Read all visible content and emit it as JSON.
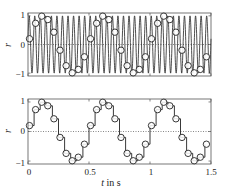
{
  "figure": {
    "background": "#ffffff",
    "line_color": "#222222",
    "frame_color": "#555555",
    "zero_line_color": "#555555"
  },
  "chart_data": [
    {
      "type": "line",
      "panel": "top",
      "title": "",
      "xlabel": "",
      "ylabel": "r",
      "xlim": [
        0,
        1.5
      ],
      "ylim": [
        -1.1,
        1.1
      ],
      "yticks": [
        -1,
        0,
        1
      ],
      "ytick_labels": [
        "−1",
        "0",
        "1"
      ],
      "xticks": [
        0,
        0.5,
        1,
        1.5
      ],
      "xtick_labels": [],
      "grid": false,
      "zero_line": "dotted",
      "series": [
        {
          "name": "continuous signal",
          "style": "solid line",
          "function": "sin(2*pi*22*t + 0.2)",
          "frequency_hz": 22,
          "phase_rad": 0.2,
          "t_start": 0,
          "t_end": 1.5
        },
        {
          "name": "samples",
          "style": "circle markers",
          "sampling_interval_s": 0.05,
          "t": [
            0,
            0.05,
            0.1,
            0.15,
            0.2,
            0.25,
            0.3,
            0.35,
            0.4,
            0.45,
            0.5,
            0.55,
            0.6,
            0.65,
            0.7,
            0.75,
            0.8,
            0.85,
            0.9,
            0.95,
            1.0,
            1.05,
            1.1,
            1.15,
            1.2,
            1.25,
            1.3,
            1.35,
            1.4,
            1.45
          ],
          "values": [
            0.2,
            0.74,
            0.99,
            0.87,
            0.43,
            -0.2,
            -0.74,
            -0.99,
            -0.87,
            -0.43,
            0.2,
            0.74,
            0.99,
            0.87,
            0.43,
            -0.2,
            -0.74,
            -0.99,
            -0.87,
            -0.43,
            0.2,
            0.74,
            0.99,
            0.87,
            0.43,
            -0.2,
            -0.74,
            -0.99,
            -0.87,
            -0.43
          ]
        }
      ]
    },
    {
      "type": "line",
      "panel": "bottom",
      "title": "",
      "xlabel": "t in s",
      "ylabel": "r",
      "xlim": [
        0,
        1.5
      ],
      "ylim": [
        -1.1,
        1.1
      ],
      "yticks": [
        -1,
        0,
        1
      ],
      "ytick_labels": [
        "−1",
        "0",
        "1"
      ],
      "xticks": [
        0,
        0.5,
        1,
        1.5
      ],
      "xtick_labels": [
        "0",
        "0.5",
        "1",
        "1.5"
      ],
      "grid": false,
      "zero_line": "dotted",
      "series": [
        {
          "name": "sample-and-hold",
          "style": "staircase with circle markers",
          "sampling_interval_s": 0.05,
          "t": [
            0,
            0.05,
            0.1,
            0.15,
            0.2,
            0.25,
            0.3,
            0.35,
            0.4,
            0.45,
            0.5,
            0.55,
            0.6,
            0.65,
            0.7,
            0.75,
            0.8,
            0.85,
            0.9,
            0.95,
            1.0,
            1.05,
            1.1,
            1.15,
            1.2,
            1.25,
            1.3,
            1.35,
            1.4,
            1.45
          ],
          "values": [
            0.2,
            0.74,
            0.99,
            0.87,
            0.43,
            -0.2,
            -0.74,
            -0.99,
            -0.87,
            -0.43,
            0.2,
            0.74,
            0.99,
            0.87,
            0.43,
            -0.2,
            -0.74,
            -0.99,
            -0.87,
            -0.43,
            0.2,
            0.74,
            0.99,
            0.87,
            0.43,
            -0.2,
            -0.74,
            -0.99,
            -0.87,
            -0.43
          ]
        }
      ]
    }
  ],
  "labels": {
    "top_ylabel": "r",
    "bottom_ylabel": "r",
    "xlabel_var": "t",
    "xlabel_unit": " in s",
    "top_yticks": [
      "1",
      "0",
      "−1"
    ],
    "bottom_yticks": [
      "1",
      "0",
      "−1"
    ],
    "bottom_xticks": [
      "0",
      "0.5",
      "1",
      "1.5"
    ]
  }
}
